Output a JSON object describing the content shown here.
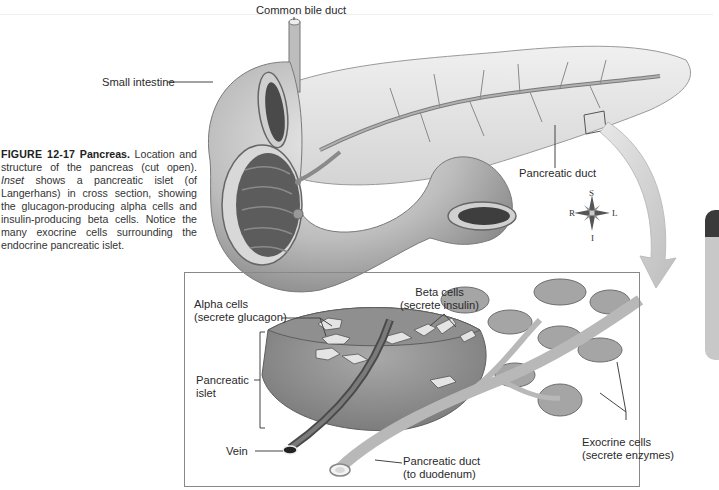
{
  "figure": {
    "number": "FIGURE 12-17",
    "title": "Pancreas.",
    "caption_part1": "Location and structure of the pancreas (cut open).",
    "caption_italic": "Inset",
    "caption_part2": "shows a pancreatic islet (of Langerhans) in cross section, showing the glucagon-producing alpha cells and insulin-producing beta cells. Notice the many exocrine cells surrounding the endocrine pancreatic islet."
  },
  "labels": {
    "common_bile_duct": "Common bile duct",
    "small_intestine": "Small intestine",
    "pancreatic_duct_main": "Pancreatic duct",
    "alpha_cells_line1": "Alpha cells",
    "alpha_cells_line2": "(secrete glucagon)",
    "beta_cells_line1": "Beta cells",
    "beta_cells_line2": "(secrete insulin)",
    "pancreatic_islet_line1": "Pancreatic",
    "pancreatic_islet_line2": "islet",
    "vein": "Vein",
    "pancreatic_duct_inset_line1": "Pancreatic duct",
    "pancreatic_duct_inset_line2": "(to duodenum)",
    "exocrine_line1": "Exocrine cells",
    "exocrine_line2": "(secrete enzymes)"
  },
  "compass": {
    "superior": "S",
    "inferior": "I",
    "right": "R",
    "left": "L"
  },
  "colors": {
    "tissue": "#b9b9b9",
    "tissue_dark": "#6f6f6f",
    "pancreas": "#e2e2e2",
    "arrow": "#cfcfcf",
    "border": "#888888"
  }
}
